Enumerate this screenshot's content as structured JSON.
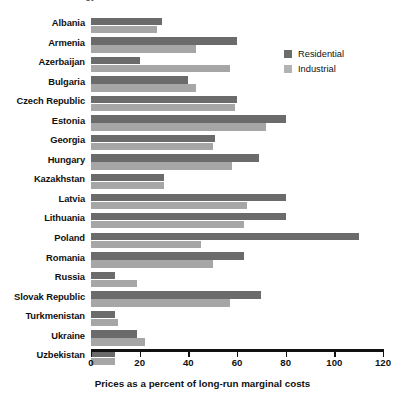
{
  "chart_data": {
    "type": "bar",
    "orientation": "horizontal",
    "title": "Energy Prices Relative to Costs in Selected Transition Economies",
    "xlabel": "Prices as a percent of long-run marginal costs",
    "ylabel": "",
    "xlim": [
      0,
      120
    ],
    "xticks": [
      0,
      20,
      40,
      60,
      80,
      100,
      120
    ],
    "grid": false,
    "legend_position": "top-right",
    "categories": [
      "Albania",
      "Armenia",
      "Azerbaijan",
      "Bulgaria",
      "Czech Republic",
      "Estonia",
      "Georgia",
      "Hungary",
      "Kazakhstan",
      "Latvia",
      "Lithuania",
      "Poland",
      "Romania",
      "Russia",
      "Slovak Republic",
      "Turkmenistan",
      "Ukraine",
      "Uzbekistan"
    ],
    "series": [
      {
        "name": "Residential",
        "color": "#6b6b6b",
        "values": [
          29,
          60,
          20,
          40,
          60,
          80,
          51,
          69,
          30,
          80,
          80,
          110,
          63,
          10,
          70,
          10,
          19,
          10
        ]
      },
      {
        "name": "Industrial",
        "color": "#a6a6a6",
        "values": [
          27,
          43,
          57,
          43,
          59,
          72,
          50,
          58,
          30,
          64,
          63,
          45,
          50,
          19,
          57,
          11,
          22,
          10
        ]
      }
    ]
  },
  "legend": {
    "items": [
      {
        "label": "Residential",
        "swatch": "residential-swatch"
      },
      {
        "label": "Industrial",
        "swatch": "industrial-swatch"
      }
    ]
  },
  "axis": {
    "tick_labels": [
      "0",
      "20",
      "40",
      "60",
      "80",
      "100",
      "120"
    ]
  }
}
